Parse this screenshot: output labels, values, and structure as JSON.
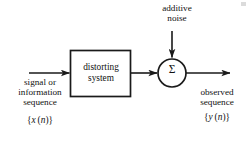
{
  "diagram": {
    "stroke_color": "#1a1a1a",
    "background_color": "#ffffff",
    "blocks": {
      "distorting_system": {
        "line1": "distorting",
        "line2": "system"
      },
      "summing_junction": {
        "symbol": "Σ",
        "name": "summer"
      }
    },
    "labels": {
      "additive_noise": {
        "line1": "additive",
        "line2": "noise"
      },
      "input": {
        "line1": "signal or",
        "line2": "information",
        "line3": "sequence",
        "sequence_open": "{",
        "sequence_var": "x",
        "sequence_paren_open": "(",
        "sequence_index": "n",
        "sequence_paren_close": ")",
        "sequence_close": "}"
      },
      "output": {
        "line1": "observed",
        "line2": "sequence",
        "sequence_open": "{",
        "sequence_var": "y",
        "sequence_paren_open": "(",
        "sequence_index": "n",
        "sequence_paren_close": ")",
        "sequence_close": "}"
      }
    },
    "arrows": [
      {
        "name": "input-arrow",
        "direction": "right"
      },
      {
        "name": "block-to-summer-arrow",
        "direction": "right"
      },
      {
        "name": "noise-arrow",
        "direction": "down"
      },
      {
        "name": "output-arrow",
        "direction": "right"
      }
    ]
  }
}
